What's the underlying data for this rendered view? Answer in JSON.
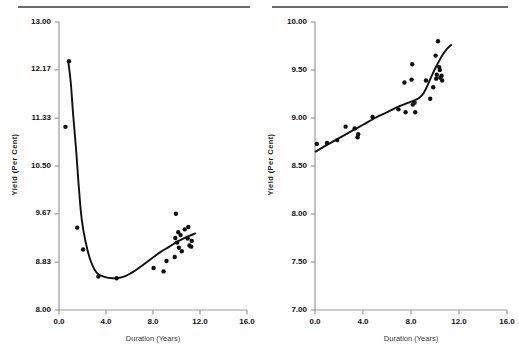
{
  "figure": {
    "background": "#fefefe",
    "rule_color": "#6b6b6b",
    "axis_color": "#9a9a9a",
    "data_color": "#101010"
  },
  "chart_data": [
    {
      "id": "left",
      "type": "scatter",
      "title": "",
      "xlabel": "Duration (Years)",
      "ylabel": "Yield (Per Cent)",
      "xlim": [
        0.0,
        16.0
      ],
      "ylim": [
        8.0,
        13.0
      ],
      "xticks": [
        0.0,
        4.0,
        8.0,
        12.0,
        16.0
      ],
      "xticklabels": [
        "0.0",
        "4.0",
        "8.0",
        "12.0",
        "16.0"
      ],
      "yticks": [
        8.0,
        8.83,
        9.67,
        10.5,
        11.33,
        12.17,
        13.0
      ],
      "yticklabels": [
        "8.00",
        "8.83",
        "9.67",
        "10.50",
        "11.33",
        "12.17",
        "13.00"
      ],
      "grid": false,
      "legend": "none",
      "series": [
        {
          "name": "Fitted yield curve",
          "type": "line",
          "marker": "none",
          "points": [
            [
              0.8,
              12.3
            ],
            [
              1.0,
              11.95
            ],
            [
              1.2,
              11.4
            ],
            [
              1.45,
              10.8
            ],
            [
              1.7,
              10.1
            ],
            [
              1.95,
              9.55
            ],
            [
              2.3,
              9.15
            ],
            [
              2.7,
              8.85
            ],
            [
              3.2,
              8.65
            ],
            [
              3.8,
              8.58
            ],
            [
              4.6,
              8.55
            ],
            [
              5.4,
              8.57
            ],
            [
              6.2,
              8.65
            ],
            [
              7.0,
              8.76
            ],
            [
              7.8,
              8.88
            ],
            [
              8.6,
              9.0
            ],
            [
              9.4,
              9.1
            ],
            [
              10.2,
              9.2
            ],
            [
              11.0,
              9.28
            ],
            [
              11.6,
              9.33
            ]
          ]
        },
        {
          "name": "Observed bond yields",
          "type": "scatter",
          "marker": "o",
          "points": [
            [
              0.85,
              12.32
            ],
            [
              0.55,
              11.18
            ],
            [
              1.55,
              9.43
            ],
            [
              2.05,
              9.05
            ],
            [
              3.35,
              8.58
            ],
            [
              4.9,
              8.55
            ],
            [
              8.05,
              8.73
            ],
            [
              8.9,
              8.67
            ],
            [
              9.15,
              8.85
            ],
            [
              9.95,
              9.67
            ],
            [
              9.85,
              8.92
            ],
            [
              9.9,
              9.25
            ],
            [
              10.05,
              9.17
            ],
            [
              10.15,
              9.35
            ],
            [
              10.2,
              9.08
            ],
            [
              10.35,
              9.3
            ],
            [
              10.45,
              9.02
            ],
            [
              10.7,
              9.4
            ],
            [
              10.95,
              9.24
            ],
            [
              11.0,
              9.44
            ],
            [
              11.1,
              9.12
            ],
            [
              11.25,
              9.1
            ],
            [
              11.3,
              9.2
            ]
          ]
        }
      ]
    },
    {
      "id": "right",
      "type": "scatter",
      "title": "",
      "xlabel": "Duration (Years)",
      "ylabel": "Yield (Per Cent)",
      "xlim": [
        0.0,
        16.0
      ],
      "ylim": [
        7.0,
        10.0
      ],
      "xticks": [
        0.0,
        4.0,
        8.0,
        12.0,
        16.0
      ],
      "xticklabels": [
        "0.0",
        "4.0",
        "8.0",
        "12.0",
        "16.0"
      ],
      "yticks": [
        7.0,
        7.5,
        8.0,
        8.5,
        9.0,
        9.5,
        10.0
      ],
      "yticklabels": [
        "7.00",
        "7.50",
        "8.00",
        "8.50",
        "9.00",
        "9.50",
        "10.00"
      ],
      "grid": false,
      "legend": "none",
      "series": [
        {
          "name": "Fitted yield curve",
          "type": "line",
          "marker": "none",
          "points": [
            [
              0.05,
              8.65
            ],
            [
              1.0,
              8.72
            ],
            [
              2.0,
              8.79
            ],
            [
              3.0,
              8.86
            ],
            [
              4.0,
              8.93
            ],
            [
              5.0,
              9.0
            ],
            [
              6.0,
              9.06
            ],
            [
              7.0,
              9.12
            ],
            [
              8.0,
              9.17
            ],
            [
              8.7,
              9.21
            ],
            [
              9.1,
              9.27
            ],
            [
              9.45,
              9.36
            ],
            [
              9.8,
              9.46
            ],
            [
              10.2,
              9.56
            ],
            [
              10.6,
              9.65
            ],
            [
              11.0,
              9.72
            ],
            [
              11.35,
              9.76
            ]
          ]
        },
        {
          "name": "Observed bond yields",
          "type": "scatter",
          "marker": "o",
          "points": [
            [
              0.15,
              8.73
            ],
            [
              1.0,
              8.74
            ],
            [
              1.85,
              8.77
            ],
            [
              2.55,
              8.91
            ],
            [
              3.3,
              8.89
            ],
            [
              3.55,
              8.8
            ],
            [
              3.6,
              8.83
            ],
            [
              4.8,
              9.01
            ],
            [
              6.95,
              9.09
            ],
            [
              7.45,
              9.37
            ],
            [
              7.55,
              9.06
            ],
            [
              8.15,
              9.14
            ],
            [
              8.3,
              9.16
            ],
            [
              8.35,
              9.06
            ],
            [
              8.1,
              9.56
            ],
            [
              8.05,
              9.4
            ],
            [
              9.25,
              9.39
            ],
            [
              9.6,
              9.2
            ],
            [
              9.85,
              9.32
            ],
            [
              10.05,
              9.65
            ],
            [
              10.1,
              9.41
            ],
            [
              10.25,
              9.8
            ],
            [
              10.35,
              9.53
            ],
            [
              10.4,
              9.5
            ],
            [
              10.45,
              9.42
            ],
            [
              10.55,
              9.44
            ],
            [
              10.6,
              9.39
            ],
            [
              10.15,
              9.45
            ]
          ]
        }
      ]
    }
  ]
}
